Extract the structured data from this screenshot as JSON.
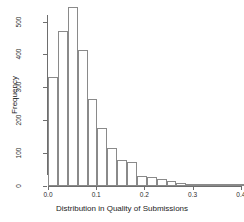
{
  "chart_data": {
    "type": "bar",
    "title": "",
    "xlabel": "Distribution in Quality of Submissions",
    "ylabel": "Frequency",
    "xlim": [
      0.0,
      0.41
    ],
    "ylim": [
      0,
      520
    ],
    "grid": false,
    "legend": null,
    "bin_width": 0.0205,
    "xticks": [
      "0.0",
      "0.1",
      "0.2",
      "0.3",
      "0.4"
    ],
    "xtick_values": [
      0.0,
      0.1,
      0.2,
      0.3,
      0.4
    ],
    "yticks": [
      "0",
      "100",
      "200",
      "300",
      "400",
      "500"
    ],
    "ytick_values": [
      0,
      100,
      200,
      300,
      400,
      500
    ],
    "bin_starts": [
      0.0,
      0.0205,
      0.041,
      0.0615,
      0.082,
      0.1025,
      0.123,
      0.1435,
      0.164,
      0.1845,
      0.205,
      0.2255,
      0.246,
      0.2665,
      0.287,
      0.3075,
      0.328,
      0.3485,
      0.369,
      0.3895
    ],
    "categories": [
      "0.000",
      "0.021",
      "0.041",
      "0.062",
      "0.082",
      "0.103",
      "0.123",
      "0.144",
      "0.164",
      "0.185",
      "0.205",
      "0.226",
      "0.246",
      "0.267",
      "0.287",
      "0.308",
      "0.328",
      "0.349",
      "0.369",
      "0.390"
    ],
    "values": [
      330,
      470,
      545,
      415,
      265,
      175,
      115,
      80,
      72,
      30,
      28,
      20,
      15,
      8,
      7,
      7,
      2,
      1,
      1,
      1
    ]
  },
  "colors": {
    "bar_stroke": "#8a8a8a",
    "bar_fill": "#ffffff",
    "axis": "#6e6e6e",
    "text": "#1c1c1c",
    "background": "#ffffff"
  }
}
